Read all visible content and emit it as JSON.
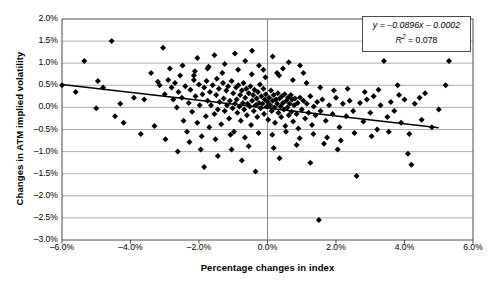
{
  "chart_data": {
    "type": "scatter",
    "title": "",
    "xlabel": "Percentage changes in index",
    "ylabel": "Changes in ATM implied volatility",
    "xlim": [
      -6.0,
      6.0
    ],
    "ylim": [
      -3.0,
      2.0
    ],
    "xunit": "%",
    "yunit": "%",
    "grid": "horizontal",
    "legend_position": "top-right",
    "xticks": [
      "-6.0%",
      "-4.0%",
      "-2.0%",
      "0.0%",
      "2.0%",
      "4.0%",
      "6.0%"
    ],
    "xtick_values": [
      -6.0,
      -4.0,
      -2.0,
      0.0,
      2.0,
      4.0,
      6.0
    ],
    "yticks": [
      "2.0%",
      "1.5%",
      "1.0%",
      "0.5%",
      "0.0%",
      "-0.5%",
      "-1.0%",
      "-1.5%",
      "-2.0%",
      "-2.5%",
      "-3.0%"
    ],
    "ytick_values": [
      2.0,
      1.5,
      1.0,
      0.5,
      0.0,
      -0.5,
      -1.0,
      -1.5,
      -2.0,
      -2.5,
      -3.0
    ],
    "annotations": {
      "equation": "y = -0.0896x - 0.0002",
      "r_squared": "R2 = 0.078",
      "equation_slope": -0.0896,
      "equation_intercept": -0.0002,
      "r_squared_value": 0.078
    },
    "trendline": {
      "x": [
        -6.0,
        5.0
      ],
      "y": [
        0.5178,
        -0.46
      ]
    },
    "marker": {
      "shape": "diamond",
      "color": "#000000",
      "size": 3
    },
    "series": [
      {
        "name": "Index vs ATM implied volatility",
        "points": [
          [
            -6.0,
            0.5
          ],
          [
            -5.35,
            1.05
          ],
          [
            -4.55,
            1.5
          ],
          [
            -4.3,
            0.08
          ],
          [
            -3.4,
            0.78
          ],
          [
            -3.15,
            0.5
          ],
          [
            -3.0,
            0.3
          ],
          [
            -2.9,
            0.62
          ],
          [
            -2.8,
            0.45
          ],
          [
            -2.75,
            0.18
          ],
          [
            -2.7,
            0.55
          ],
          [
            -2.65,
            0.0
          ],
          [
            -2.6,
            0.35
          ],
          [
            -2.55,
            0.72
          ],
          [
            -2.5,
            0.22
          ],
          [
            -2.45,
            -0.3
          ],
          [
            -2.4,
            0.48
          ],
          [
            -2.35,
            -0.55
          ],
          [
            -2.3,
            0.1
          ],
          [
            -2.25,
            0.4
          ],
          [
            -2.2,
            -0.1
          ],
          [
            -2.15,
            0.62
          ],
          [
            -2.1,
            0.25
          ],
          [
            -2.05,
            -0.35
          ],
          [
            -2.0,
            0.52
          ],
          [
            -1.98,
            0.05
          ],
          [
            -1.95,
            -0.95
          ],
          [
            -1.9,
            0.3
          ],
          [
            -1.85,
            0.45
          ],
          [
            -1.8,
            -0.2
          ],
          [
            -1.78,
            0.6
          ],
          [
            -1.75,
            0.15
          ],
          [
            -1.7,
            -0.45
          ],
          [
            -1.68,
            0.35
          ],
          [
            -1.65,
            0.05
          ],
          [
            -1.6,
            0.5
          ],
          [
            -1.55,
            -0.15
          ],
          [
            -1.5,
            0.28
          ],
          [
            -1.48,
            0.65
          ],
          [
            -1.45,
            -0.05
          ],
          [
            -1.42,
            0.42
          ],
          [
            -1.4,
            0.12
          ],
          [
            -1.35,
            -0.38
          ],
          [
            -1.3,
            0.55
          ],
          [
            -1.28,
            0.2
          ],
          [
            -1.25,
            -0.08
          ],
          [
            -1.2,
            0.38
          ],
          [
            -1.18,
            0.05
          ],
          [
            -1.15,
            0.48
          ],
          [
            -1.12,
            -0.25
          ],
          [
            -1.1,
            0.15
          ],
          [
            -1.05,
            0.6
          ],
          [
            -1.02,
            -0.02
          ],
          [
            -1.0,
            0.32
          ],
          [
            -0.98,
            -0.55
          ],
          [
            -0.95,
            0.08
          ],
          [
            -0.92,
            0.45
          ],
          [
            -0.9,
            0.18
          ],
          [
            -0.88,
            -0.12
          ],
          [
            -0.85,
            0.5
          ],
          [
            -0.82,
            0.02
          ],
          [
            -0.8,
            0.28
          ],
          [
            -0.78,
            -0.3
          ],
          [
            -0.75,
            0.38
          ],
          [
            -0.72,
            0.1
          ],
          [
            -0.7,
            0.55
          ],
          [
            -0.68,
            -0.05
          ],
          [
            -0.65,
            0.22
          ],
          [
            -0.62,
            0.42
          ],
          [
            -0.6,
            -0.18
          ],
          [
            -0.58,
            0.08
          ],
          [
            -0.55,
            0.32
          ],
          [
            -0.52,
            0.02
          ],
          [
            -0.5,
            0.48
          ],
          [
            -0.48,
            -0.4
          ],
          [
            -0.45,
            0.15
          ],
          [
            -0.42,
            0.28
          ],
          [
            -0.4,
            -0.08
          ],
          [
            -0.38,
            0.4
          ],
          [
            -0.35,
            0.05
          ],
          [
            -0.32,
            0.2
          ],
          [
            -0.3,
            -0.22
          ],
          [
            -0.28,
            0.35
          ],
          [
            -0.25,
            0.1
          ],
          [
            -0.22,
            0.52
          ],
          [
            -0.2,
            -0.02
          ],
          [
            -0.18,
            0.25
          ],
          [
            -0.15,
            0.08
          ],
          [
            -0.12,
            0.42
          ],
          [
            -0.1,
            -0.15
          ],
          [
            -0.08,
            0.18
          ],
          [
            -0.05,
            0.3
          ],
          [
            -0.02,
            0.02
          ],
          [
            0.0,
            0.12
          ],
          [
            0.02,
            -0.28
          ],
          [
            0.05,
            0.22
          ],
          [
            0.08,
            0.05
          ],
          [
            0.1,
            0.38
          ],
          [
            0.12,
            -0.08
          ],
          [
            0.15,
            0.15
          ],
          [
            0.18,
            0.28
          ],
          [
            0.2,
            0.0
          ],
          [
            0.22,
            -0.35
          ],
          [
            0.25,
            0.18
          ],
          [
            0.28,
            0.08
          ],
          [
            0.3,
            0.32
          ],
          [
            0.32,
            -0.12
          ],
          [
            0.35,
            0.2
          ],
          [
            0.38,
            0.02
          ],
          [
            0.4,
            -0.22
          ],
          [
            0.42,
            0.25
          ],
          [
            0.45,
            0.1
          ],
          [
            0.48,
            -0.05
          ],
          [
            0.5,
            0.3
          ],
          [
            0.52,
            -0.42
          ],
          [
            0.55,
            0.15
          ],
          [
            0.58,
            0.0
          ],
          [
            0.6,
            0.22
          ],
          [
            0.62,
            -0.18
          ],
          [
            0.65,
            0.08
          ],
          [
            0.68,
            0.28
          ],
          [
            0.7,
            -0.1
          ],
          [
            0.72,
            0.18
          ],
          [
            0.75,
            -0.32
          ],
          [
            0.78,
            0.05
          ],
          [
            0.8,
            0.2
          ],
          [
            0.85,
            -0.15
          ],
          [
            0.88,
            0.1
          ],
          [
            0.9,
            -0.48
          ],
          [
            0.95,
            0.22
          ],
          [
            1.0,
            -0.05
          ],
          [
            1.05,
            0.15
          ],
          [
            1.1,
            -0.25
          ],
          [
            1.15,
            0.08
          ],
          [
            1.2,
            -0.12
          ],
          [
            1.25,
            0.25
          ],
          [
            1.3,
            -0.4
          ],
          [
            1.35,
            0.02
          ],
          [
            1.4,
            -0.18
          ],
          [
            1.45,
            0.12
          ],
          [
            1.5,
            -2.55
          ],
          [
            1.55,
            -0.08
          ],
          [
            1.6,
            0.18
          ],
          [
            1.7,
            -0.3
          ],
          [
            1.8,
            0.05
          ],
          [
            1.9,
            -0.15
          ],
          [
            2.0,
            0.22
          ],
          [
            2.1,
            -0.45
          ],
          [
            2.2,
            0.08
          ],
          [
            2.3,
            -0.2
          ],
          [
            2.4,
            0.15
          ],
          [
            2.5,
            -0.08
          ],
          [
            2.6,
            -1.55
          ],
          [
            2.7,
            0.1
          ],
          [
            2.8,
            -0.32
          ],
          [
            2.9,
            0.18
          ],
          [
            3.0,
            -0.12
          ],
          [
            3.1,
            0.25
          ],
          [
            3.2,
            -0.5
          ],
          [
            3.3,
            0.05
          ],
          [
            3.4,
            1.05
          ],
          [
            3.5,
            -0.22
          ],
          [
            3.6,
            0.12
          ],
          [
            3.7,
            -0.08
          ],
          [
            3.8,
            0.5
          ],
          [
            3.9,
            -0.35
          ],
          [
            4.0,
            0.18
          ],
          [
            4.1,
            -1.05
          ],
          [
            4.2,
            -1.3
          ],
          [
            4.3,
            0.08
          ],
          [
            4.5,
            -0.28
          ],
          [
            4.6,
            0.32
          ],
          [
            4.8,
            -0.45
          ],
          [
            5.0,
            -0.05
          ],
          [
            5.2,
            0.5
          ],
          [
            5.3,
            1.05
          ],
          [
            -5.0,
            -0.02
          ],
          [
            -4.8,
            0.45
          ],
          [
            -4.2,
            -0.35
          ],
          [
            -3.9,
            0.22
          ],
          [
            -3.7,
            -0.6
          ],
          [
            -3.6,
            0.18
          ],
          [
            -3.3,
            -0.42
          ],
          [
            -3.2,
            0.58
          ],
          [
            -2.98,
            -0.72
          ],
          [
            -2.85,
            0.88
          ],
          [
            -2.62,
            -1.0
          ],
          [
            -2.48,
            0.95
          ],
          [
            -2.28,
            -0.78
          ],
          [
            -2.12,
            0.82
          ],
          [
            -1.92,
            -0.65
          ],
          [
            -1.72,
            0.92
          ],
          [
            -1.52,
            -0.72
          ],
          [
            -1.32,
            0.78
          ],
          [
            -1.08,
            -0.62
          ],
          [
            -0.86,
            0.85
          ],
          [
            -0.66,
            -0.68
          ],
          [
            -0.46,
            0.75
          ],
          [
            -0.26,
            -0.58
          ],
          [
            -0.06,
            0.68
          ],
          [
            0.14,
            -0.62
          ],
          [
            0.34,
            0.72
          ],
          [
            0.54,
            -0.55
          ],
          [
            0.74,
            0.62
          ],
          [
            0.94,
            -0.7
          ],
          [
            1.14,
            0.55
          ],
          [
            1.34,
            -0.6
          ],
          [
            1.54,
            0.45
          ],
          [
            1.74,
            -0.68
          ],
          [
            1.94,
            0.38
          ],
          [
            2.14,
            -0.75
          ],
          [
            2.34,
            0.42
          ],
          [
            2.54,
            -0.58
          ],
          [
            2.84,
            0.35
          ],
          [
            3.04,
            -0.65
          ],
          [
            3.24,
            0.4
          ],
          [
            3.54,
            -0.55
          ],
          [
            3.84,
            0.28
          ],
          [
            4.14,
            -0.6
          ],
          [
            4.44,
            0.22
          ],
          [
            -5.6,
            0.35
          ],
          [
            -4.95,
            0.6
          ],
          [
            -4.45,
            -0.2
          ],
          [
            -3.05,
            1.35
          ],
          [
            -2.05,
            1.12
          ],
          [
            -1.55,
            1.18
          ],
          [
            -0.95,
            1.22
          ],
          [
            -0.45,
            1.28
          ],
          [
            0.15,
            1.15
          ],
          [
            0.95,
            0.95
          ],
          [
            -0.65,
            1.05
          ],
          [
            -0.25,
            0.95
          ],
          [
            0.45,
            0.88
          ],
          [
            1.05,
            0.78
          ],
          [
            -1.25,
            0.98
          ],
          [
            -1.75,
            0.88
          ],
          [
            -2.15,
            0.72
          ],
          [
            0.62,
            1.02
          ],
          [
            -0.12,
            0.85
          ],
          [
            0.28,
            0.78
          ],
          [
            -1.45,
            -1.1
          ],
          [
            -0.75,
            -1.2
          ],
          [
            0.35,
            -1.15
          ],
          [
            1.25,
            -1.25
          ],
          [
            -0.55,
            -0.88
          ],
          [
            0.18,
            -0.92
          ],
          [
            0.85,
            -0.85
          ],
          [
            -1.05,
            -0.95
          ],
          [
            2.05,
            -0.95
          ],
          [
            -0.35,
            -1.45
          ],
          [
            1.65,
            -0.82
          ],
          [
            -1.85,
            -1.35
          ]
        ]
      }
    ]
  }
}
